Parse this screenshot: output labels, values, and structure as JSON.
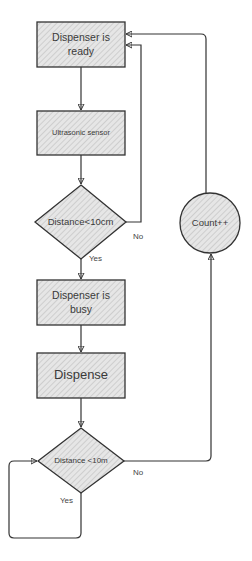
{
  "diagram": {
    "type": "flowchart",
    "colors": {
      "stroke": "#333333",
      "fill": "#e4e4e4",
      "hatch": "#c8c8c8",
      "text": "#3a3a3a"
    },
    "nodes": [
      {
        "id": "ready",
        "shape": "rectangle",
        "label": "Dispenser is\nready"
      },
      {
        "id": "sensor",
        "shape": "rectangle",
        "label": "Ultrasonic sensor"
      },
      {
        "id": "check1",
        "shape": "diamond",
        "label": "Distance<10cm"
      },
      {
        "id": "busy",
        "shape": "rectangle",
        "label": "Dispenser is\nbusy"
      },
      {
        "id": "dispense",
        "shape": "rectangle",
        "label": "Dispense"
      },
      {
        "id": "check2",
        "shape": "diamond",
        "label": "Distance <10m"
      },
      {
        "id": "count",
        "shape": "circle",
        "label": "Count++"
      }
    ],
    "edges": [
      {
        "from": "ready",
        "to": "sensor",
        "label": ""
      },
      {
        "from": "sensor",
        "to": "check1",
        "label": ""
      },
      {
        "from": "check1",
        "to": "busy",
        "label": "Yes"
      },
      {
        "from": "check1",
        "to": "ready",
        "label": "No"
      },
      {
        "from": "busy",
        "to": "dispense",
        "label": ""
      },
      {
        "from": "dispense",
        "to": "check2",
        "label": ""
      },
      {
        "from": "check2",
        "to": "check2",
        "label": "Yes"
      },
      {
        "from": "check2",
        "to": "count",
        "label": "No"
      },
      {
        "from": "count",
        "to": "ready",
        "label": ""
      }
    ],
    "edge_labels": {
      "check1_yes": "Yes",
      "check1_no": "No",
      "check2_yes": "Yes",
      "check2_no": "No"
    }
  }
}
